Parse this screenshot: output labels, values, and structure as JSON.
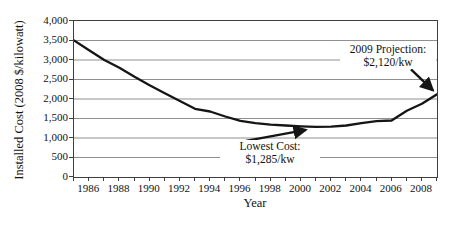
{
  "figure": {
    "y_axis_title": "Installed Cost (2008 $/kilowatt)",
    "x_axis_title": "Year",
    "y_tick_labels": [
      "4,000",
      "3,500",
      "3,000",
      "2,500",
      "2,000",
      "1,500",
      "1,000",
      "500",
      "0"
    ],
    "x_tick_label_years": [
      1986,
      1988,
      1990,
      1992,
      1994,
      1996,
      1998,
      2000,
      2002,
      2004,
      2006,
      2008
    ]
  },
  "annotations": {
    "projection": {
      "line1": "2009 Projection:",
      "line2": "$2,120/kw"
    },
    "lowest": {
      "line1": "Lowest Cost:",
      "line2": "$1,285/kw"
    }
  },
  "colors": {
    "line": "#151515",
    "grid": "#8f8f8f",
    "axis": "#3f3f3f",
    "background": "#ffffff",
    "text": "#111111"
  },
  "chart_data": {
    "type": "line",
    "title": "",
    "xlabel": "Year",
    "ylabel": "Installed Cost (2008 $/kilowatt)",
    "x": [
      1985,
      1986,
      1987,
      1988,
      1989,
      1990,
      1991,
      1992,
      1993,
      1994,
      1995,
      1996,
      1997,
      1998,
      1999,
      2000,
      2001,
      2002,
      2003,
      2004,
      2005,
      2006,
      2007,
      2008,
      2009
    ],
    "values": [
      3500,
      3250,
      3000,
      2800,
      2570,
      2350,
      2150,
      1950,
      1750,
      1680,
      1550,
      1440,
      1380,
      1340,
      1320,
      1300,
      1285,
      1290,
      1320,
      1380,
      1430,
      1450,
      1700,
      1880,
      2120
    ],
    "ylim": [
      0,
      4000
    ],
    "ytick_step": 500,
    "xtick_label_years": [
      1986,
      1988,
      1990,
      1992,
      1994,
      1996,
      1998,
      2000,
      2002,
      2004,
      2006,
      2008
    ],
    "grid": "horizontal",
    "legend": "none",
    "annotations": [
      {
        "text": "2009 Projection: $2,120/kw",
        "target_year": 2009,
        "target_value": 2120
      },
      {
        "text": "Lowest Cost: $1,285/kw",
        "target_year": 2001,
        "target_value": 1285
      }
    ]
  }
}
